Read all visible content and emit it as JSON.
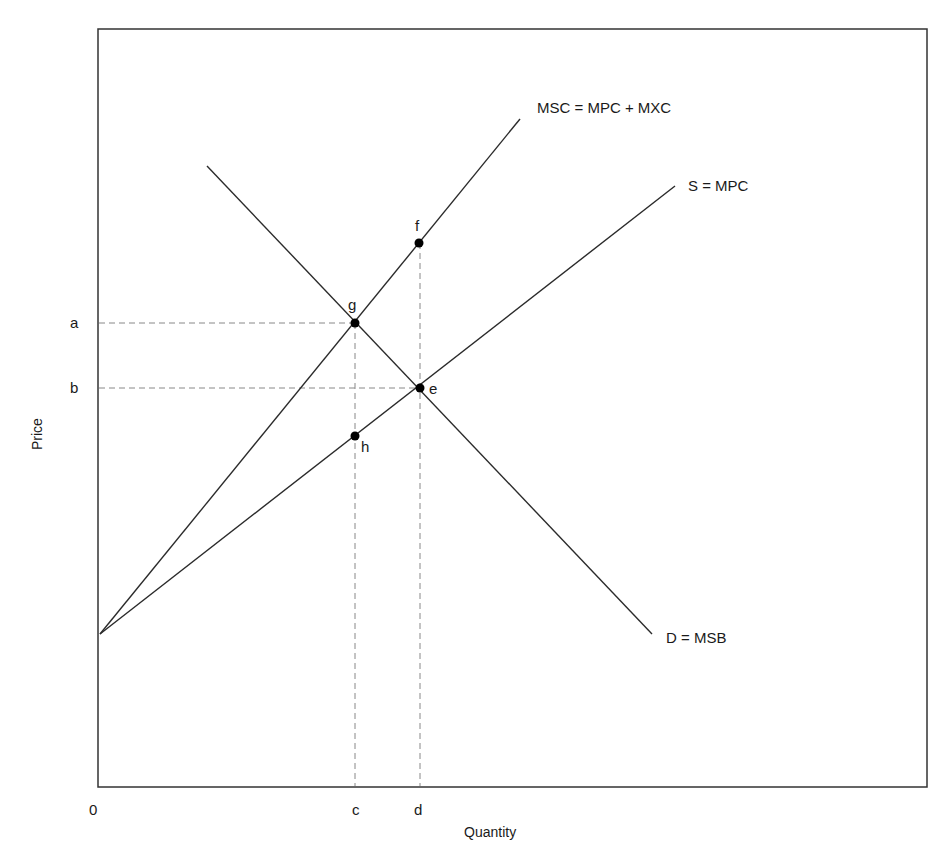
{
  "diagram": {
    "type": "economics-externality-supply-demand",
    "axes": {
      "x_title": "Quantity",
      "y_title": "Price",
      "origin_label": "0"
    },
    "price_ticks": [
      {
        "label": "a",
        "y": 323
      },
      {
        "label": "b",
        "y": 388
      }
    ],
    "quantity_ticks": [
      {
        "label": "c",
        "x": 355
      },
      {
        "label": "d",
        "x": 420
      }
    ],
    "curves": [
      {
        "id": "msc",
        "label": "MSC = MPC + MXC",
        "from": [
          100,
          634
        ],
        "to": [
          520,
          119
        ],
        "label_pos": [
          537,
          113
        ]
      },
      {
        "id": "supply",
        "label": "S = MPC",
        "from": [
          100,
          634
        ],
        "to": [
          675,
          186
        ],
        "label_pos": [
          688,
          191
        ]
      },
      {
        "id": "demand",
        "label": "D = MSB",
        "from": [
          207,
          166
        ],
        "to": [
          652,
          634
        ],
        "label_pos": [
          666,
          643
        ]
      }
    ],
    "points": [
      {
        "label": "g",
        "x": 355,
        "y": 323,
        "label_pos": [
          348,
          310
        ]
      },
      {
        "label": "f",
        "x": 419,
        "y": 243,
        "label_pos": [
          415,
          231
        ]
      },
      {
        "label": "e",
        "x": 420,
        "y": 388,
        "label_pos": [
          429,
          394
        ]
      },
      {
        "label": "h",
        "x": 355,
        "y": 436,
        "label_pos": [
          361,
          452
        ]
      }
    ],
    "colors": {
      "line": "#2b2b2b",
      "frame": "#333333",
      "guide": "#888888",
      "point": "#000000",
      "background": "#ffffff"
    }
  }
}
